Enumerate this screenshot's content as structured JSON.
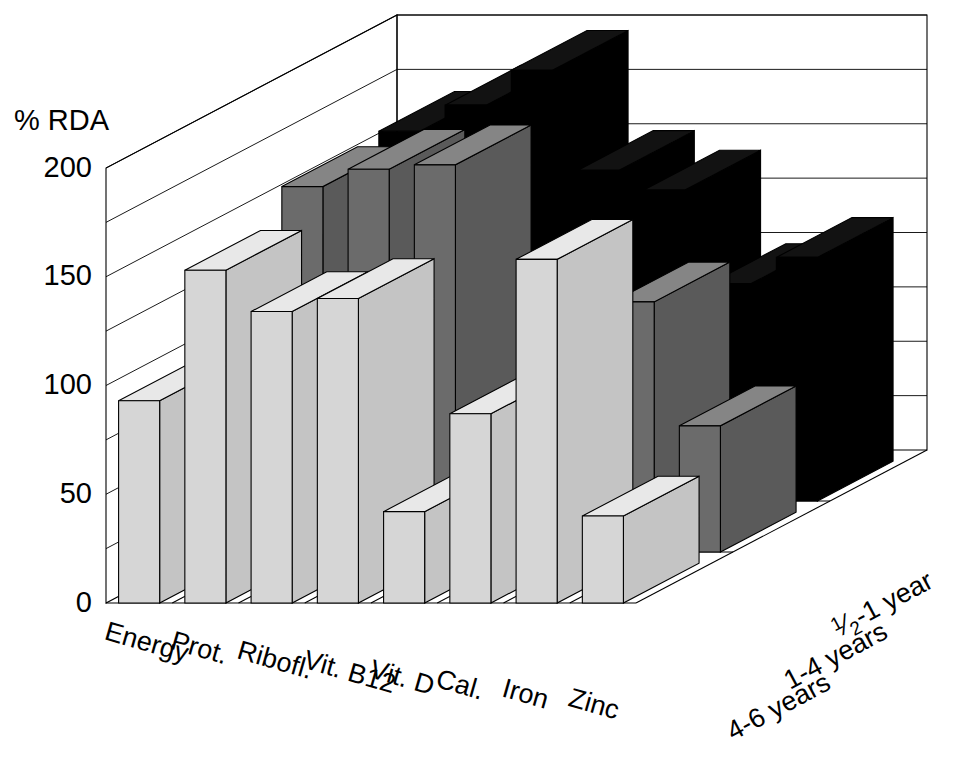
{
  "chart_data": {
    "type": "bar",
    "subtype": "3d-grouped-bar",
    "title": "",
    "xlabel": "",
    "ylabel": "% RDA",
    "ylim": [
      0,
      200
    ],
    "yticks": [
      0,
      50,
      100,
      150,
      200
    ],
    "ytick_labels": [
      "0",
      "50",
      "100",
      "150",
      "200"
    ],
    "gridline_interval": 25,
    "grid": true,
    "legend_position": "depth-axis-right",
    "categories": [
      "Energy",
      "Prot.",
      "Ribofl.",
      "Vit. B12",
      "Vit. D",
      "Cal.",
      "Iron",
      "Zinc"
    ],
    "series": [
      {
        "name": "4-6 years",
        "color": "#d6d6d6",
        "values": [
          93,
          153,
          134,
          140,
          42,
          87,
          158,
          40
        ]
      },
      {
        "name": "1-4 years",
        "color": "#6b6b6b",
        "values": [
          122,
          168,
          176,
          178,
          68,
          90,
          115,
          58
        ]
      },
      {
        "name": "½-1 year",
        "color": "#000000",
        "values": [
          120,
          170,
          182,
          198,
          152,
          143,
          100,
          112
        ]
      }
    ],
    "series_labels_rendered": [
      "4-6 years",
      "1-4 years",
      "1/2-1 year"
    ]
  },
  "axis": {
    "y_title": "% RDA",
    "y_ticks": [
      "200",
      "150",
      "100",
      "50",
      "0"
    ],
    "category_labels": [
      "Energy",
      "Prot.",
      "Ribofl.",
      "Vit. B12",
      "Vit. D",
      "Cal.",
      "Iron",
      "Zinc"
    ],
    "series_labels": [
      {
        "text": "4-6 years",
        "is_fraction": false,
        "numerator": "",
        "denominator": "",
        "rest": ""
      },
      {
        "text": "1-4 years",
        "is_fraction": false,
        "numerator": "",
        "denominator": "",
        "rest": ""
      },
      {
        "text": "½-1 year",
        "is_fraction": true,
        "numerator": "1",
        "denominator": "2",
        "rest": "-1 year"
      }
    ]
  },
  "colors": {
    "background": "#ffffff",
    "outline": "#000000",
    "series_front_face": "#d6d6d6",
    "series_front_top": "#e8e8e8",
    "series_front_side": "#c4c4c4",
    "series_mid_face": "#6b6b6b",
    "series_mid_top": "#858585",
    "series_mid_side": "#5a5a5a",
    "series_back_face": "#000000",
    "series_back_top": "#121212",
    "series_back_side": "#000000"
  }
}
